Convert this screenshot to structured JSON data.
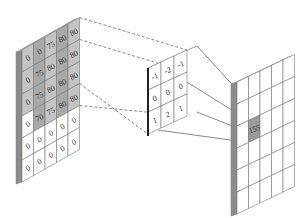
{
  "input_grid": {
    "rows": 6,
    "cols": 5,
    "values": [
      [
        "0",
        "0",
        "75",
        "80",
        "80"
      ],
      [
        "0",
        "75",
        "80",
        "80",
        "80"
      ],
      [
        "0",
        "75",
        "80",
        "80",
        "80"
      ],
      [
        "0",
        "70",
        "75",
        "80",
        "80"
      ],
      [
        "0",
        "0",
        "0",
        "0",
        "0"
      ],
      [
        "0",
        "0",
        "0",
        "0",
        "0"
      ]
    ],
    "shaded_rows": [
      0,
      1,
      2,
      3
    ]
  },
  "kernel": {
    "rows": 3,
    "cols": 3,
    "values": [
      [
        "-1",
        "-2",
        "-1"
      ],
      [
        "0",
        "0",
        "0"
      ],
      [
        "1",
        "2",
        "1"
      ]
    ]
  },
  "output_grid": {
    "rows": 6,
    "cols": 5,
    "highlight_cell": {
      "row": 2,
      "col": 1,
      "value": "155"
    }
  },
  "colors": {
    "shaded": "#a9a9a9",
    "shaded_light": "#c4c4c4",
    "edge": "#8c8c8c",
    "line": "#555555",
    "highlight": "#9a9a9a"
  }
}
